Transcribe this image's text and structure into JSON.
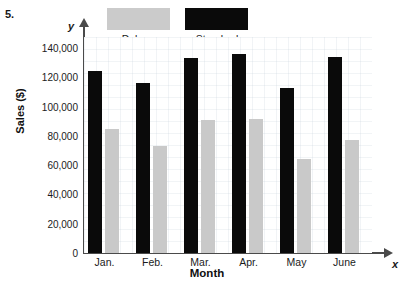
{
  "problem_number": "5.",
  "chart_data": {
    "type": "bar",
    "title": "",
    "xlabel": "Month",
    "ylabel": "Sales ($)",
    "x_axis_name": "x",
    "y_axis_name": "y",
    "categories": [
      "Jan.",
      "Feb.",
      "Mar.",
      "Apr.",
      "May",
      "June"
    ],
    "series": [
      {
        "name": "Standard",
        "color": "#0a0a0a",
        "values": [
          124000,
          116000,
          133000,
          136000,
          113000,
          134000
        ]
      },
      {
        "name": "Deluxe",
        "color": "#c9c9c9",
        "values": [
          85000,
          73000,
          91000,
          91500,
          64000,
          77000
        ]
      }
    ],
    "ylim": [
      0,
      145000
    ],
    "yticks": [
      0,
      20000,
      40000,
      60000,
      80000,
      100000,
      120000,
      140000
    ],
    "ytick_labels": [
      "0",
      "20,000",
      "40,000",
      "60,000",
      "80,000",
      "100,000",
      "120,000",
      "140,000"
    ],
    "grid": true,
    "legend_position": "top",
    "legend": [
      {
        "label": "Deluxe",
        "color": "#c9c9c9"
      },
      {
        "label": "Standard",
        "color": "#0a0a0a"
      }
    ]
  }
}
